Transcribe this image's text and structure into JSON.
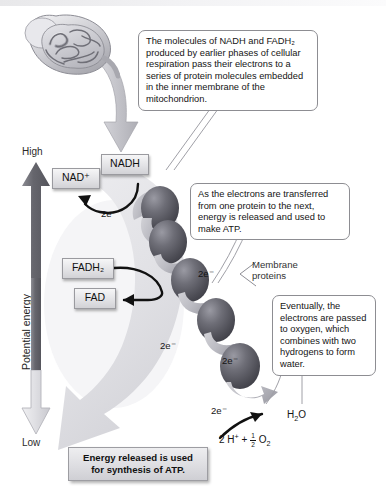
{
  "figure": {
    "organelle_label": "mitochondrion"
  },
  "callouts": [
    {
      "id": "callout-nadh-fadh2",
      "text": "The molecules of NADH and FADH₂ produced by earlier phases of cellular respiration pass their electrons to a series of protein molecules embedded in the inner membrane of the mitochondrion."
    },
    {
      "id": "callout-energy-atp",
      "text": "As the electrons are transferred from one protein to the next, energy is released and used to make ATP."
    },
    {
      "id": "callout-oxygen-water",
      "text": "Eventually, the electrons are passed to oxygen, which combines with two hydrogens to form water."
    }
  ],
  "axis": {
    "high_label": "High",
    "low_label": "Low",
    "vertical_label": "Potential energy"
  },
  "chips": [
    {
      "id": "chip-nad-plus",
      "label": "NAD⁺"
    },
    {
      "id": "chip-nadh",
      "label": "NADH"
    },
    {
      "id": "chip-fadh2",
      "label": "FADH₂"
    },
    {
      "id": "chip-fad",
      "label": "FAD"
    }
  ],
  "electron_labels": [
    {
      "id": "electron-label-1",
      "text": "2e⁻"
    },
    {
      "id": "electron-label-2",
      "text": "2e⁻"
    },
    {
      "id": "electron-label-3",
      "text": "2e⁻"
    },
    {
      "id": "electron-label-4",
      "text": "2e⁻"
    },
    {
      "id": "electron-label-5",
      "text": "2e⁻"
    },
    {
      "id": "electron-label-6",
      "text": "2e⁻"
    }
  ],
  "membrane_proteins_label": {
    "line1": "Membrane",
    "line2": "proteins"
  },
  "products": {
    "water_label": "H₂O",
    "reactants_prefix": "2 H",
    "reactants_charge": "+",
    "reactants_plus": "+",
    "fraction_numerator": "1",
    "fraction_denominator": "2",
    "oxygen": "O",
    "oxygen_sub": "2"
  },
  "atp_banner": {
    "line1": "Energy released is used",
    "line2": "for synthesis of ATP."
  },
  "colors": {
    "protein_sphere_dark": "#4a4a50",
    "protein_sphere_light": "#8f8f98",
    "chip_border": "#9a9a9f",
    "callout_border": "#8d8d92",
    "axis_arrow_high": "#6e6e74",
    "axis_arrow_low": "#c9c9ce",
    "swoosh": "#e0e0e3",
    "background": "#ffffff"
  }
}
